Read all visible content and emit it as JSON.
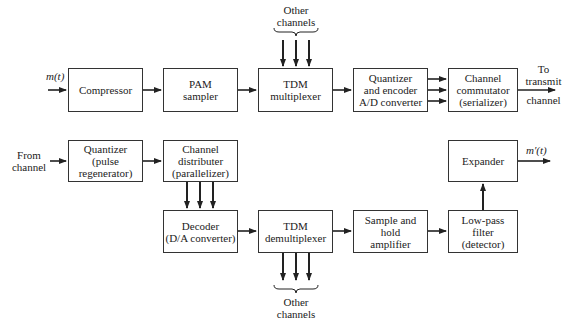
{
  "diagram": {
    "transmitter": {
      "input_label": "m(t)",
      "blocks": [
        {
          "id": "compressor",
          "label": "Compressor"
        },
        {
          "id": "pam_sampler",
          "label": "PAM\nsampler"
        },
        {
          "id": "tdm_multiplexer",
          "label": "TDM\nmultiplexer"
        },
        {
          "id": "quantizer_encoder",
          "label": "Quantizer\nand encoder\nA/D converter"
        },
        {
          "id": "channel_commutator",
          "label": "Channel\ncommutator\n(serializer)"
        }
      ],
      "other_channels_label": "Other\nchannels",
      "output_label_top": "To\ntransmit",
      "output_label_bottom": "channel"
    },
    "receiver": {
      "input_label": "From\nchannel",
      "blocks": [
        {
          "id": "quantizer_regen",
          "label": "Quantizer\n(pulse\nregenerator)"
        },
        {
          "id": "channel_distributer",
          "label": "Channel\ndistributer\n(parallelizer)"
        },
        {
          "id": "decoder",
          "label": "Decoder\n(D/A converter)"
        },
        {
          "id": "tdm_demultiplexer",
          "label": "TDM\ndemultiplexer"
        },
        {
          "id": "sample_hold",
          "label": "Sample and\nhold\namplifier"
        },
        {
          "id": "low_pass_filter",
          "label": "Low-pass\nfilter\n(detector)"
        },
        {
          "id": "expander",
          "label": "Expander"
        }
      ],
      "other_channels_label": "Other\nchannels",
      "output_label": "m′(t)"
    }
  }
}
